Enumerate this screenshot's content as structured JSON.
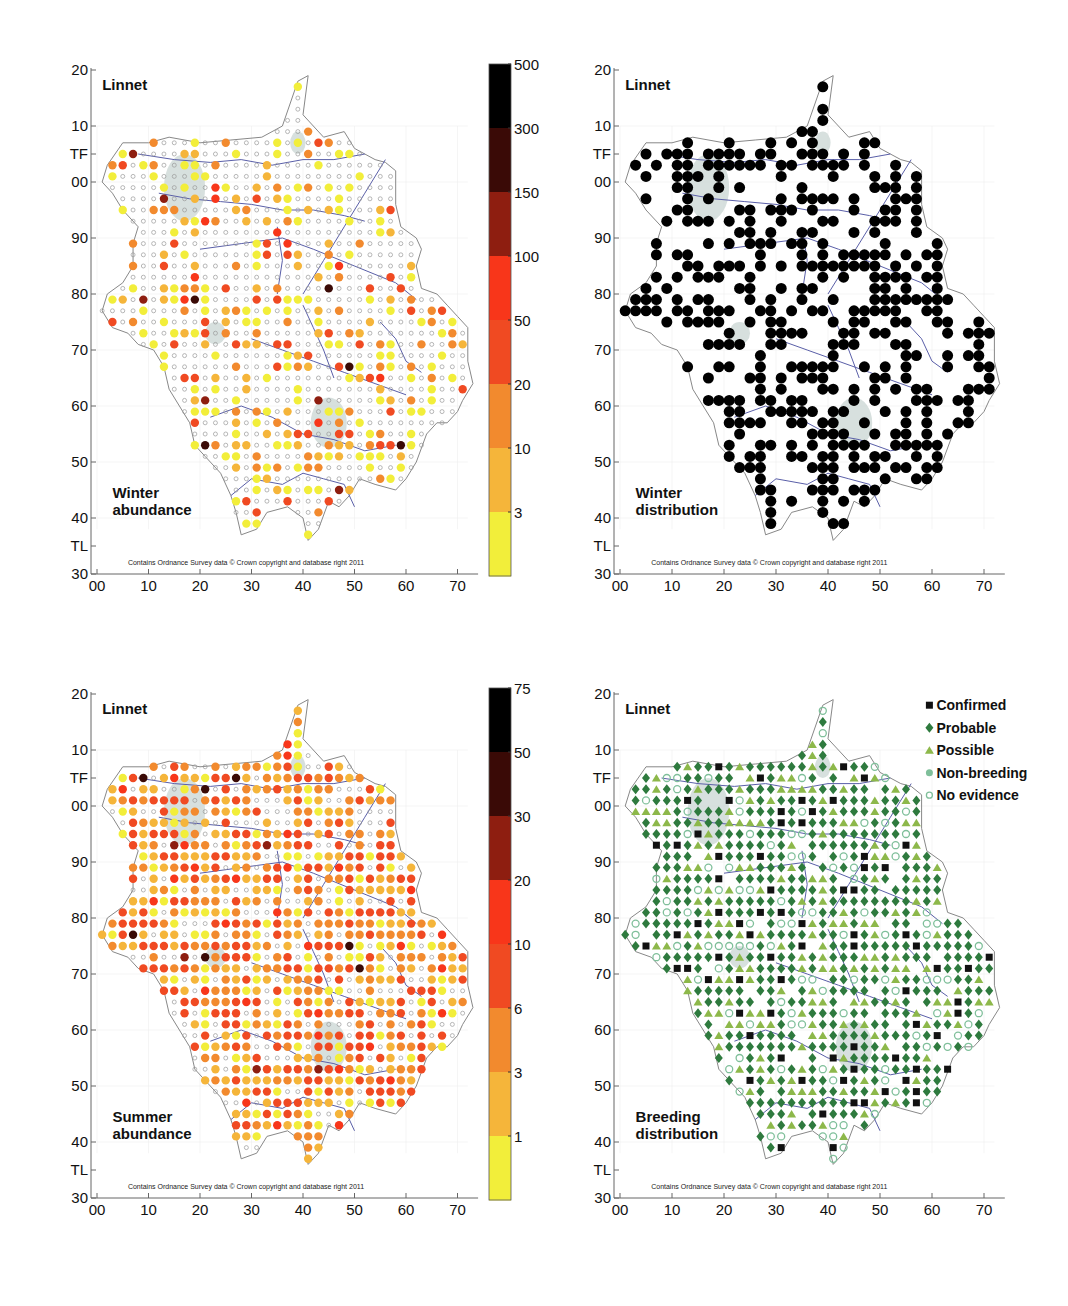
{
  "chart_data": [
    {
      "type": "scatter",
      "title": "Linnet",
      "subtitle": "Winter abundance",
      "copyright": "Contains Ordnance Survey data © Crown copyright and database right 2011",
      "x_ticks": [
        "00",
        "10",
        "20",
        "30",
        "40",
        "50",
        "60",
        "70"
      ],
      "y_ticks": [
        "20",
        "10",
        "TF",
        "00",
        "90",
        "80",
        "70",
        "60",
        "50",
        "40",
        "TL",
        "30"
      ],
      "colorbar": {
        "labels": [
          "500",
          "300",
          "150",
          "100",
          "50",
          "20",
          "10",
          "3"
        ],
        "colors": [
          "#000000",
          "#3a0a06",
          "#8e1e10",
          "#f8361a",
          "#f04a22",
          "#f28a2e",
          "#f5b53a",
          "#f2ee3a"
        ]
      },
      "mode": "winter_abundance"
    },
    {
      "type": "scatter",
      "title": "Linnet",
      "subtitle": "Winter distribution",
      "copyright": "Contains Ordnance Survey data © Crown copyright and database right 2011",
      "x_ticks": [
        "00",
        "10",
        "20",
        "30",
        "40",
        "50",
        "60",
        "70"
      ],
      "y_ticks": [
        "20",
        "10",
        "TF",
        "00",
        "90",
        "80",
        "70",
        "60",
        "50",
        "40",
        "TL",
        "30"
      ],
      "mode": "winter_distribution"
    },
    {
      "type": "scatter",
      "title": "Linnet",
      "subtitle": "Summer abundance",
      "copyright": "Contains Ordnance Survey data © Crown copyright and database right 2011",
      "x_ticks": [
        "00",
        "10",
        "20",
        "30",
        "40",
        "50",
        "60",
        "70"
      ],
      "y_ticks": [
        "20",
        "10",
        "TF",
        "00",
        "90",
        "80",
        "70",
        "60",
        "50",
        "40",
        "TL",
        "30"
      ],
      "colorbar": {
        "labels": [
          "75",
          "50",
          "30",
          "20",
          "10",
          "6",
          "3",
          "1"
        ],
        "colors": [
          "#000000",
          "#3a0a06",
          "#8e1e10",
          "#f8361a",
          "#f04a22",
          "#f28a2e",
          "#f5b53a",
          "#f2ee3a"
        ]
      },
      "mode": "summer_abundance"
    },
    {
      "type": "scatter",
      "title": "Linnet",
      "subtitle": "Breeding distribution",
      "copyright": "Contains Ordnance Survey data © Crown copyright and database right 2011",
      "x_ticks": [
        "00",
        "10",
        "20",
        "30",
        "40",
        "50",
        "60",
        "70"
      ],
      "y_ticks": [
        "20",
        "10",
        "TF",
        "00",
        "90",
        "80",
        "70",
        "60",
        "50",
        "40",
        "TL",
        "30"
      ],
      "legend": [
        {
          "label": "Confirmed",
          "marker": "square",
          "color": "#111111"
        },
        {
          "label": "Probable",
          "marker": "diamond",
          "color": "#2e7a3e"
        },
        {
          "label": "Possible",
          "marker": "triangle",
          "color": "#8db84a"
        },
        {
          "label": "Non-breeding",
          "marker": "circle",
          "color": "#7fbf9a"
        },
        {
          "label": "No evidence",
          "marker": "ring",
          "color": "#7fbf9a"
        }
      ],
      "mode": "breeding_distribution"
    }
  ],
  "panels": [
    {
      "title": "Linnet",
      "caption_line1": "Winter",
      "caption_line2": "abundance"
    },
    {
      "title": "Linnet",
      "caption_line1": "Winter",
      "caption_line2": "distribution"
    },
    {
      "title": "Linnet",
      "caption_line1": "Summer",
      "caption_line2": "abundance"
    },
    {
      "title": "Linnet",
      "caption_line1": "Breeding",
      "caption_line2": "distribution"
    }
  ],
  "copyright": "Contains Ordnance Survey data © Crown copyright and database right 2011",
  "x_ticks": [
    "00",
    "10",
    "20",
    "30",
    "40",
    "50",
    "60",
    "70"
  ],
  "y_ticks": [
    "20",
    "10",
    "TF",
    "00",
    "90",
    "80",
    "70",
    "60",
    "50",
    "40",
    "TL",
    "30"
  ],
  "colorbar_winter": [
    "500",
    "300",
    "150",
    "100",
    "50",
    "20",
    "10",
    "3"
  ],
  "colorbar_summer": [
    "75",
    "50",
    "30",
    "20",
    "10",
    "6",
    "3",
    "1"
  ],
  "legend": [
    "Confirmed",
    "Probable",
    "Possible",
    "Non-breeding",
    "No evidence"
  ]
}
